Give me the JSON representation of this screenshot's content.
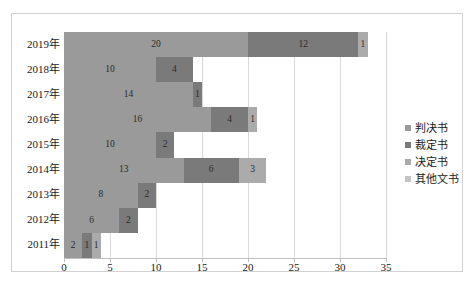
{
  "chart_data": {
    "type": "bar",
    "orientation": "horizontal",
    "stacked": true,
    "title": "",
    "xlabel": "",
    "ylabel": "",
    "categories": [
      "2019年",
      "2018年",
      "2017年",
      "2016年",
      "2015年",
      "2014年",
      "2013年",
      "2012年",
      "2011年"
    ],
    "series": [
      {
        "name": "判决书",
        "color": "#9a9a9a",
        "values": [
          20,
          10,
          14,
          16,
          10,
          13,
          8,
          6,
          2
        ]
      },
      {
        "name": "裁定书",
        "color": "#7a7a7a",
        "values": [
          12,
          4,
          1,
          4,
          2,
          6,
          2,
          2,
          1
        ]
      },
      {
        "name": "决定书",
        "color": "#ababab",
        "values": [
          1,
          0,
          0,
          1,
          0,
          3,
          0,
          0,
          1
        ]
      },
      {
        "name": "其他文书",
        "color": "#c4c4c4",
        "values": [
          0,
          0,
          0,
          0,
          0,
          0,
          0,
          0,
          0
        ]
      }
    ],
    "xticks": [
      0,
      5,
      10,
      15,
      20,
      25,
      30,
      35
    ],
    "xlim": [
      0,
      35
    ],
    "grid": true,
    "legend_position": "right",
    "data_labels": true,
    "bar_totals": [
      33,
      14,
      15,
      21,
      12,
      22,
      10,
      8,
      4
    ]
  },
  "legend": {
    "items": [
      {
        "label": "判决书",
        "color": "#9a9a9a"
      },
      {
        "label": "裁定书",
        "color": "#7a7a7a"
      },
      {
        "label": "决定书",
        "color": "#ababab"
      },
      {
        "label": "其他文书",
        "color": "#c4c4c4"
      }
    ]
  }
}
